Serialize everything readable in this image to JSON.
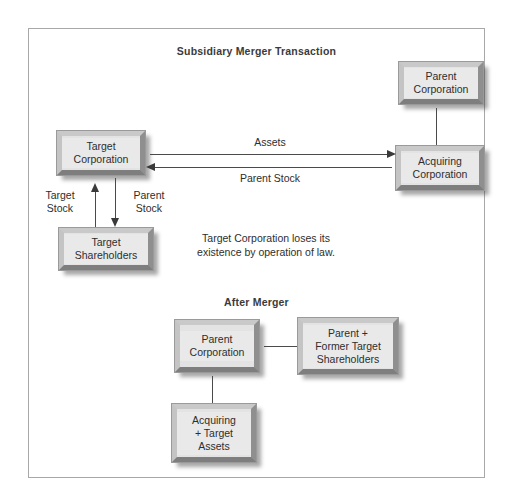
{
  "figure": {
    "title": "Subsidiary Merger Transaction",
    "after_title": "After Merger",
    "note": "Target Corporation loses its\nexistence by operation of law.",
    "frame_color": "#a8a8a8",
    "box_fill": "#e3e3e3",
    "line_color": "#4a4a4a",
    "text_color": "#2e2e2e"
  },
  "nodes": {
    "target_corporation": "Target\nCorporation",
    "target_shareholders": "Target\nShareholders",
    "parent_corporation": "Parent\nCorporation",
    "acquiring_corporation": "Acquiring\nCorporation",
    "after_parent_corporation": "Parent\nCorporation",
    "after_parent_former_target_shareholders": "Parent +\nFormer Target\nShareholders",
    "after_acquiring_target_assets": "Acquiring\n+ Target\nAssets"
  },
  "edges": {
    "assets": "Assets",
    "parent_stock_horizontal": "Parent Stock",
    "target_stock_vertical": "Target\nStock",
    "parent_stock_vertical": "Parent\nStock"
  }
}
